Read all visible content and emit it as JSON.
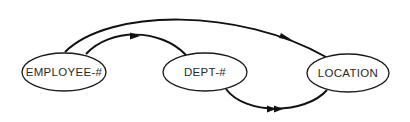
{
  "diagram": {
    "type": "functional-dependency-graph",
    "colors": {
      "background": "#ffffff",
      "stroke": "#111111",
      "text": "#2a2a2a"
    },
    "nodes": [
      {
        "id": "employee",
        "label": "EMPLOYEE-#"
      },
      {
        "id": "dept",
        "label": "DEPT-#"
      },
      {
        "id": "location",
        "label": "LOCATION"
      }
    ],
    "edges": [
      {
        "id": "employee-to-location",
        "from": "EMPLOYEE-#",
        "to": "LOCATION",
        "arrow": "single"
      },
      {
        "id": "employee-to-dept",
        "from": "EMPLOYEE-#",
        "to": "DEPT-#",
        "arrow": "single"
      },
      {
        "id": "dept-to-location",
        "from": "DEPT-#",
        "to": "LOCATION",
        "arrow": "double"
      }
    ]
  }
}
